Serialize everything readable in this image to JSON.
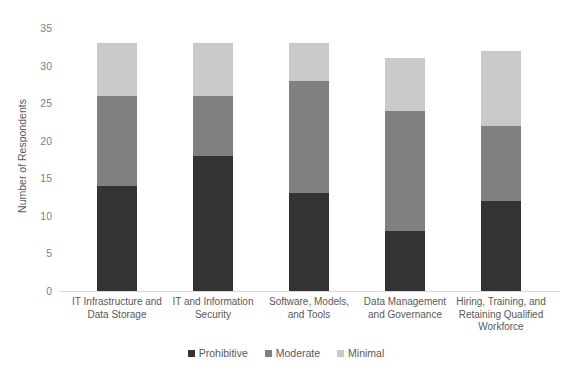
{
  "chart_data": {
    "type": "bar",
    "subtype": "stacked-bar-vertical",
    "title": "",
    "xlabel": "",
    "ylabel": "Number of Respondents",
    "ylim": [
      0,
      35
    ],
    "ytick_values": [
      35,
      30,
      25,
      20,
      15,
      10,
      5,
      0
    ],
    "ytick_labels": [
      "35",
      "30",
      "25",
      "20",
      "15",
      "10",
      "5",
      "0"
    ],
    "grid": false,
    "legend_position": "bottom-center",
    "categories": [
      "IT Infrastructure and Data Storage",
      "IT and Information Security",
      "Software, Models, and Tools",
      "Data Management and Governance",
      "Hiring, Training, and Retaining Qualified Workforce"
    ],
    "category_lines": [
      [
        "IT Infrastructure and",
        "Data Storage"
      ],
      [
        "IT and Information",
        "Security"
      ],
      [
        "Software, Models,",
        "and Tools"
      ],
      [
        "Data Management",
        "and Governance"
      ],
      [
        "Hiring, Training, and",
        "Retaining Qualified",
        "Workforce"
      ]
    ],
    "series": [
      {
        "name": "Prohibitive",
        "color": "#333333",
        "values": [
          14,
          18,
          13,
          8,
          12
        ]
      },
      {
        "name": "Moderate",
        "color": "#808080",
        "values": [
          12,
          8,
          15,
          16,
          10
        ]
      },
      {
        "name": "Minimal",
        "color": "#c9c9c9",
        "values": [
          7,
          7,
          5,
          7,
          10
        ]
      }
    ],
    "totals": [
      33,
      33,
      33,
      31,
      32
    ]
  },
  "legend": {
    "items": [
      {
        "label": "Prohibitive",
        "color": "#333333"
      },
      {
        "label": "Moderate",
        "color": "#808080"
      },
      {
        "label": "Minimal",
        "color": "#c9c9c9"
      }
    ]
  },
  "colors": {
    "prohibitive": "#333333",
    "moderate": "#808080",
    "minimal": "#c9c9c9",
    "axis": "#d9d9d9",
    "text": "#595959",
    "tick_text": "#808080",
    "background": "#ffffff"
  }
}
